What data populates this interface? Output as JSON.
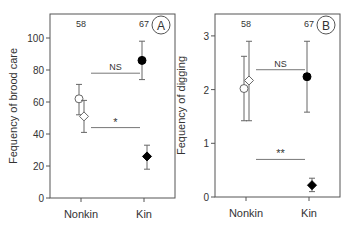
{
  "chart_data": [
    {
      "type": "scatter",
      "panel_label": "A",
      "title": "",
      "xlabel": "",
      "ylabel": "Fequency of brood care",
      "categories": [
        "Nonkin",
        "Kin"
      ],
      "ylim": [
        0,
        110
      ],
      "yticks": [
        0,
        20,
        40,
        60,
        80,
        100
      ],
      "sample_sizes": [
        "58",
        "67"
      ],
      "series": [
        {
          "name": "circle",
          "marker": "circle",
          "values": [
            62,
            86
          ],
          "error_low": [
            52,
            74
          ],
          "error_high": [
            71,
            98
          ],
          "fill": [
            "open",
            "filled"
          ]
        },
        {
          "name": "diamond",
          "marker": "diamond",
          "values": [
            51,
            26
          ],
          "error_low": [
            41,
            18
          ],
          "error_high": [
            61,
            33
          ],
          "fill": [
            "open",
            "filled"
          ]
        }
      ],
      "annotations": [
        {
          "text": "NS",
          "compares": "circle",
          "y": 78
        },
        {
          "text": "*",
          "compares": "diamond",
          "y": 44
        }
      ],
      "grid": false
    },
    {
      "type": "scatter",
      "panel_label": "B",
      "title": "",
      "xlabel": "",
      "ylabel": "Fequency of digging",
      "categories": [
        "Nonkin",
        "Kin"
      ],
      "ylim": [
        0,
        3.4
      ],
      "yticks": [
        0,
        1,
        2,
        3
      ],
      "sample_sizes": [
        "58",
        "67"
      ],
      "series": [
        {
          "name": "circle",
          "marker": "circle",
          "values": [
            2.02,
            2.24
          ],
          "error_low": [
            1.42,
            1.58
          ],
          "error_high": [
            2.62,
            2.9
          ],
          "fill": [
            "open",
            "filled"
          ]
        },
        {
          "name": "diamond",
          "marker": "diamond",
          "values": [
            2.17,
            0.22
          ],
          "error_low": [
            1.42,
            0.1
          ],
          "error_high": [
            2.9,
            0.35
          ],
          "fill": [
            "open",
            "filled"
          ]
        }
      ],
      "annotations": [
        {
          "text": "NS",
          "compares": "circle",
          "y": 2.37
        },
        {
          "text": "**",
          "compares": "diamond",
          "y": 0.7
        }
      ],
      "grid": false
    }
  ]
}
